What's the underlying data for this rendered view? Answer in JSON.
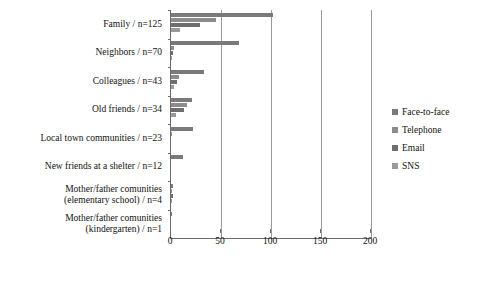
{
  "chart_data": {
    "type": "bar",
    "orientation": "horizontal",
    "title": "",
    "xlabel": "",
    "ylabel": "",
    "xlim": [
      0,
      200
    ],
    "xticks": [
      0,
      50,
      100,
      150,
      200
    ],
    "grid": true,
    "legend_position": "right",
    "categories": [
      "Family / n=125",
      "Neighbors / n=70",
      "Colleagues / n=43",
      "Old friends / n=34",
      "Local town communities / n=23",
      "New friends at a shelter / n=12",
      "Mother/father comunities (elementary school) / n=4",
      "Mother/father comunities (kindergarten) / n=1"
    ],
    "category_lines": [
      [
        "Family / n=125"
      ],
      [
        "Neighbors / n=70"
      ],
      [
        "Colleagues / n=43"
      ],
      [
        "Old friends / n=34"
      ],
      [
        "Local town communities / n=23"
      ],
      [
        "New friends at a shelter / n=12"
      ],
      [
        "Mother/father comunities",
        "(elementary school) / n=4"
      ],
      [
        "Mother/father comunities",
        "(kindergarten) / n=1"
      ]
    ],
    "series": [
      {
        "name": "Face-to-face",
        "color": "#7a7a7a",
        "values": [
          102,
          68,
          33,
          21,
          22,
          12,
          2,
          1
        ]
      },
      {
        "name": "Telephone",
        "color": "#8c8c8c",
        "values": [
          45,
          3,
          8,
          16,
          1,
          0,
          1,
          0
        ]
      },
      {
        "name": "Email",
        "color": "#6e6e6e",
        "values": [
          29,
          2,
          6,
          13,
          0,
          0,
          2,
          0
        ]
      },
      {
        "name": "SNS",
        "color": "#9a9a9a",
        "values": [
          9,
          1,
          3,
          5,
          0,
          0,
          1,
          0
        ]
      }
    ]
  },
  "legend": {
    "items": [
      {
        "label": "Face-to-face"
      },
      {
        "label": "Telephone"
      },
      {
        "label": "Email"
      },
      {
        "label": "SNS"
      }
    ]
  },
  "axis": {
    "tick_labels": [
      "0",
      "50",
      "100",
      "150",
      "200"
    ]
  }
}
